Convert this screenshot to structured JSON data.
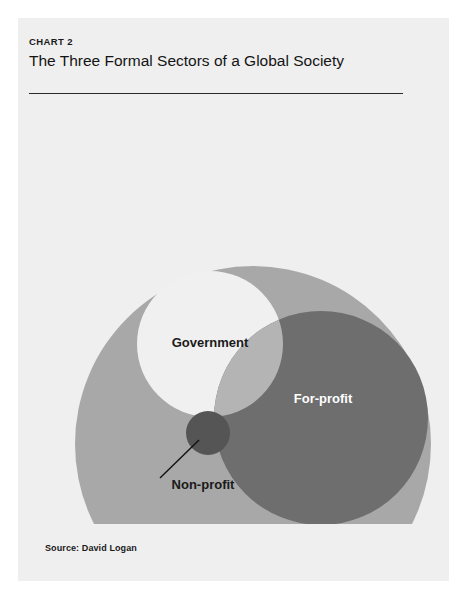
{
  "header": {
    "eyebrow": "CHART 2",
    "title": "The Three Formal Sectors of a Global Society"
  },
  "source": {
    "text": "Source: David Logan"
  },
  "chart_data": {
    "type": "venn",
    "title": "The Three Formal Sectors of a Global Society",
    "subtitle": "CHART 2",
    "legend_position": "in-figure",
    "grid": false,
    "sets": [
      {
        "name": "Informal sector",
        "label": "Informal sector",
        "label_color": "#555555",
        "fill": "#a8a8a8",
        "cx": 235,
        "cy": 340,
        "r": 178,
        "label_x": 265,
        "label_y": 460,
        "label_anchor": "middle",
        "role": "container"
      },
      {
        "name": "Government",
        "label": "Government",
        "label_color": "#1a1a1a",
        "fill": "#f0f0f0",
        "cx": 192,
        "cy": 240,
        "r": 73,
        "label_x": 192,
        "label_y": 243,
        "label_anchor": "middle",
        "role": "formal-sector"
      },
      {
        "name": "For-profit",
        "label": "For-profit",
        "label_color": "#ffffff",
        "fill": "#6e6e6e",
        "cx": 303,
        "cy": 314,
        "r": 107,
        "label_x": 305,
        "label_y": 299,
        "label_anchor": "middle",
        "role": "formal-sector"
      },
      {
        "name": "Non-profit",
        "label": "Non-profit",
        "label_color": "#1a1a1a",
        "fill": "#555555",
        "cx": 190,
        "cy": 329,
        "r": 22,
        "label_x": 185,
        "label_y": 385,
        "label_anchor": "middle",
        "role": "intersection",
        "has_leader_line": true,
        "leader_from_x": 142,
        "leader_from_y": 374,
        "leader_to_x": 181,
        "leader_to_y": 336
      }
    ],
    "overlaps": [
      {
        "between": [
          "Government",
          "For-profit"
        ],
        "fill": "#b4b4b4"
      }
    ],
    "colors": {
      "card_background": "#efefef",
      "page_background": "#ffffff",
      "rule": "#2b2b2b",
      "informal_sector": "#a8a8a8",
      "government": "#f0f0f0",
      "for_profit": "#6e6e6e",
      "non_profit": "#555555",
      "overlap_gov_forprofit": "#b4b4b4",
      "leader_line": "#111111"
    }
  }
}
